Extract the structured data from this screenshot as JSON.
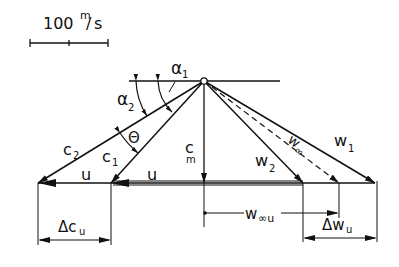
{
  "scale_bar": {
    "value": "100",
    "unit_num": "m",
    "unit_den": "s"
  },
  "labels": {
    "alpha1": "α",
    "alpha1_sub": "1",
    "alpha2": "α",
    "alpha2_sub": "2",
    "theta": "Θ",
    "c2": "c",
    "c2_sub": "2",
    "c1": "c",
    "c1_sub": "1",
    "cm": "c",
    "cm_sub": "m",
    "w2": "w",
    "w2_sub": "2",
    "winf": "w",
    "winf_sub": "∞",
    "w1": "w",
    "w1_sub": "1",
    "u_left": "u",
    "u_right": "u",
    "dcu": "Δc",
    "dcu_sub": "u",
    "dwu": "Δw",
    "dwu_sub": "u",
    "winfu": "w",
    "winfu_sub": "∞u"
  },
  "colors": {
    "ink": "#111111",
    "background": "#ffffff"
  }
}
